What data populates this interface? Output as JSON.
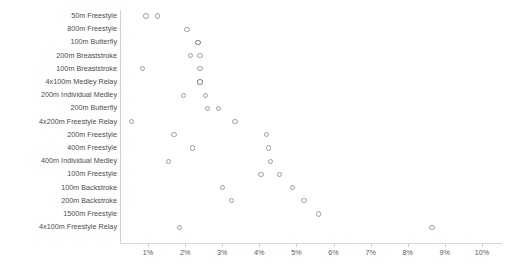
{
  "chart_data": {
    "type": "scatter",
    "title": "",
    "subtitle": "",
    "xlabel": "",
    "ylabel": "",
    "grid": false,
    "legend": "none",
    "xlim": [
      0.4,
      10.4
    ],
    "x_tick_labels": [
      "1%",
      "2%",
      "3%",
      "4%",
      "5%",
      "6%",
      "7%",
      "8%",
      "9%",
      "10%"
    ],
    "x_tick_values": [
      1,
      2,
      3,
      4,
      5,
      6,
      7,
      8,
      9,
      10
    ],
    "categories": [
      "50m Freestyle",
      "800m Freestyle",
      "100m Butterfly",
      "200m Breaststroke",
      "100m Breaststroke",
      "4x100m Medley Relay",
      "200m Individual Medley",
      "200m Butterfly",
      "4x200m Freestyle Relay",
      "200m Freestyle",
      "400m Freestyle",
      "400m Individual Medley",
      "100m Freestyle",
      "100m Backstroke",
      "200m Backstroke",
      "1500m Freestyle",
      "4x100m Freestyle Relay"
    ],
    "series": [
      {
        "name": "series-a",
        "values": [
          0.95,
          2.05,
          2.35,
          2.15,
          0.85,
          2.4,
          1.95,
          2.6,
          0.55,
          1.7,
          2.2,
          1.55,
          4.05,
          3.0,
          3.25,
          5.6,
          1.85
        ]
      },
      {
        "name": "series-b",
        "values": [
          1.25,
          null,
          null,
          2.4,
          2.4,
          null,
          2.55,
          2.9,
          3.35,
          4.2,
          4.25,
          4.3,
          4.55,
          4.9,
          5.2,
          null,
          8.65
        ]
      }
    ],
    "points": [
      {
        "category": "50m Freestyle",
        "x": 0.95,
        "emphasis": false
      },
      {
        "category": "50m Freestyle",
        "x": 1.25,
        "emphasis": false
      },
      {
        "category": "800m Freestyle",
        "x": 2.05,
        "emphasis": false
      },
      {
        "category": "100m Butterfly",
        "x": 2.35,
        "emphasis": true
      },
      {
        "category": "200m Breaststroke",
        "x": 2.15,
        "emphasis": false
      },
      {
        "category": "200m Breaststroke",
        "x": 2.4,
        "emphasis": false
      },
      {
        "category": "100m Breaststroke",
        "x": 0.85,
        "emphasis": false
      },
      {
        "category": "100m Breaststroke",
        "x": 2.4,
        "emphasis": false
      },
      {
        "category": "4x100m Medley Relay",
        "x": 2.4,
        "emphasis": true
      },
      {
        "category": "200m Individual Medley",
        "x": 1.95,
        "emphasis": false
      },
      {
        "category": "200m Individual Medley",
        "x": 2.55,
        "emphasis": false
      },
      {
        "category": "200m Butterfly",
        "x": 2.6,
        "emphasis": false
      },
      {
        "category": "200m Butterfly",
        "x": 2.9,
        "emphasis": false
      },
      {
        "category": "4x200m Freestyle Relay",
        "x": 0.55,
        "emphasis": false
      },
      {
        "category": "4x200m Freestyle Relay",
        "x": 3.35,
        "emphasis": false
      },
      {
        "category": "200m Freestyle",
        "x": 1.7,
        "emphasis": false
      },
      {
        "category": "200m Freestyle",
        "x": 4.2,
        "emphasis": false
      },
      {
        "category": "400m Freestyle",
        "x": 2.2,
        "emphasis": false
      },
      {
        "category": "400m Freestyle",
        "x": 4.25,
        "emphasis": false
      },
      {
        "category": "400m Individual Medley",
        "x": 1.55,
        "emphasis": false
      },
      {
        "category": "400m Individual Medley",
        "x": 4.3,
        "emphasis": false
      },
      {
        "category": "100m Freestyle",
        "x": 4.05,
        "emphasis": false
      },
      {
        "category": "100m Freestyle",
        "x": 4.55,
        "emphasis": false
      },
      {
        "category": "100m Backstroke",
        "x": 3.0,
        "emphasis": false
      },
      {
        "category": "100m Backstroke",
        "x": 4.9,
        "emphasis": false
      },
      {
        "category": "200m Backstroke",
        "x": 3.25,
        "emphasis": false
      },
      {
        "category": "200m Backstroke",
        "x": 5.2,
        "emphasis": false
      },
      {
        "category": "1500m Freestyle",
        "x": 5.6,
        "emphasis": false
      },
      {
        "category": "4x100m Freestyle Relay",
        "x": 1.85,
        "emphasis": false
      },
      {
        "category": "4x100m Freestyle Relay",
        "x": 8.65,
        "emphasis": false
      }
    ]
  },
  "style": {
    "dot_stroke": "#9a9aa2",
    "dot_stroke_bold": "#6f6f78",
    "axis_color": "#d0d0d0",
    "label_color": "#4c4c4c",
    "background": "#ffffff"
  },
  "geometry": {
    "axis_x_px": 120,
    "axis_y_px": 241,
    "x_origin_px": 148,
    "x_scale_px_per_pct": 37.1,
    "row_top_px": 16,
    "row_step_px": 13.2
  }
}
